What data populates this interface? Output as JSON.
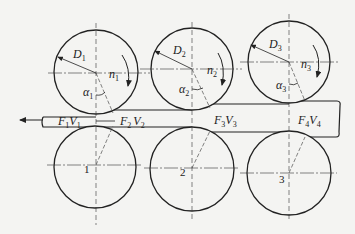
{
  "diagram": {
    "type": "multi-stand rolling mill (continuous rolling) schematic",
    "stands": [
      {
        "number": "1",
        "diameter_label": "D",
        "diameter_sub": "1",
        "speed_label": "n",
        "speed_sub": "1",
        "angle_label": "α",
        "angle_sub": "1"
      },
      {
        "number": "2",
        "diameter_label": "D",
        "diameter_sub": "2",
        "speed_label": "n",
        "speed_sub": "2",
        "angle_label": "α",
        "angle_sub": "2"
      },
      {
        "number": "3",
        "diameter_label": "D",
        "diameter_sub": "3",
        "speed_label": "n",
        "speed_sub": "3",
        "angle_label": "α",
        "angle_sub": "3"
      }
    ],
    "strip_sections": [
      {
        "F": "F",
        "F_sub": "1",
        "V": "V",
        "V_sub": "1"
      },
      {
        "F": "F",
        "F_sub": "2",
        "V": "V",
        "V_sub": "2"
      },
      {
        "F": "F",
        "F_sub": "3",
        "V": "V",
        "V_sub": "3"
      },
      {
        "F": "F",
        "F_sub": "4",
        "V": "V",
        "V_sub": "4"
      }
    ],
    "rolling_direction": "left",
    "colors": {
      "line": "#222222",
      "background": "#f4f4f2"
    }
  }
}
